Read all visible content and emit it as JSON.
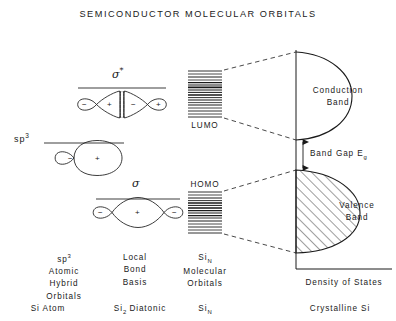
{
  "figure": {
    "title": "SEMICONDUCTOR  MOLECULAR  ORBITALS",
    "background": "#ffffff",
    "ink": "#1a1a1a"
  },
  "orbitals": {
    "sp3_symbol": "sp",
    "sp3_superscript": "3",
    "sigma_star_symbol": "σ",
    "sigma_star_superscript": "*",
    "sigma_symbol": "σ",
    "lobe_signs": {
      "sp3_small": "−",
      "sp3_large": "+",
      "sigma_star_outer_left": "−",
      "sigma_star_inner_left": "+",
      "sigma_star_inner_right": "−",
      "sigma_star_outer_right": "+",
      "sigma_outer_left": "−",
      "sigma_center": "+",
      "sigma_outer_right": "−"
    }
  },
  "levels": {
    "lumo_label": "LUMO",
    "homo_label": "HOMO"
  },
  "bands": {
    "conduction_line1": "Conduction",
    "conduction_line2": "Band",
    "valence_line1": "Valence",
    "valence_line2": "Band",
    "band_gap_text": "Band  Gap  E",
    "band_gap_subscript": "g",
    "x_axis_label": "Density  of  States"
  },
  "columns": [
    {
      "name": "si-atom",
      "head_line1": "sp",
      "head_line1_sup": "3",
      "head_line2": "Atomic",
      "head_line3": "Hybrid",
      "head_line4": "Orbitals",
      "footer": "Si  Atom"
    },
    {
      "name": "si2-diatomic",
      "head_line1": "Local",
      "head_line2": "Bond",
      "head_line3": "Basis",
      "footer_pre": "Si",
      "footer_sub": "2",
      "footer_post": "  Diatonic"
    },
    {
      "name": "si-n-molecular",
      "head_line1_pre": "Si",
      "head_line1_sub": "N",
      "head_line2": "Molecular",
      "head_line3": "Orbitals",
      "footer_pre": "Si",
      "footer_sub": "N"
    },
    {
      "name": "crystalline-si",
      "footer": "Crystalline  Si"
    }
  ]
}
